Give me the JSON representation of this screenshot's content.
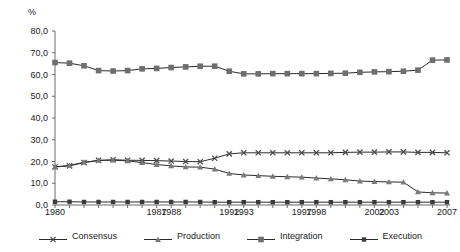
{
  "chart_data": {
    "type": "line",
    "title": "",
    "xlabel": "",
    "ylabel": "%",
    "ylim": [
      0,
      80
    ],
    "ytick_step": 10,
    "ytick_labels": [
      "80,0",
      "70,0",
      "60,0",
      "50,0",
      "40,0",
      "30,0",
      "20,0",
      "10,0",
      "0,0"
    ],
    "ytick_values": [
      80,
      70,
      60,
      50,
      40,
      30,
      20,
      10,
      0
    ],
    "grid": false,
    "legend_position": "bottom",
    "x": [
      1980,
      1981,
      1982,
      1983,
      1984,
      1985,
      1986,
      1987,
      1988,
      1989,
      1990,
      1991,
      1992,
      1993,
      1994,
      1995,
      1996,
      1997,
      1998,
      1999,
      2000,
      2001,
      2002,
      2003,
      2004,
      2005,
      2006,
      2007
    ],
    "xtick_labels": [
      "1980",
      "1987",
      "1988",
      "1992",
      "1993",
      "1997",
      "1998",
      "2002",
      "2003",
      "2007"
    ],
    "xtick_values": [
      1980,
      1987,
      1988,
      1992,
      1993,
      1997,
      1998,
      2002,
      2003,
      2007
    ],
    "series": [
      {
        "name": "Consensus",
        "marker": "x",
        "color": "#4d4d4d",
        "values": [
          17.5,
          18.0,
          19.5,
          20.5,
          20.8,
          20.6,
          20.5,
          20.4,
          20.2,
          20.0,
          19.9,
          21.5,
          23.5,
          24.0,
          24.0,
          24.0,
          24.0,
          24.0,
          24.0,
          24.0,
          24.2,
          24.3,
          24.3,
          24.4,
          24.4,
          24.2,
          24.2,
          24.0
        ]
      },
      {
        "name": "Production",
        "marker": "triangle",
        "color": "#7a7a7a",
        "values": [
          17.5,
          18.2,
          19.6,
          20.5,
          20.6,
          20.3,
          19.5,
          18.6,
          18.0,
          17.5,
          17.4,
          16.5,
          14.5,
          13.8,
          13.5,
          13.2,
          13.0,
          12.8,
          12.4,
          12.0,
          11.6,
          11.0,
          10.8,
          10.6,
          10.5,
          6.0,
          5.6,
          5.5
        ]
      },
      {
        "name": "Integration",
        "marker": "square",
        "color": "#6e6e6e",
        "values": [
          65.5,
          65.2,
          64.0,
          61.8,
          61.6,
          61.8,
          62.6,
          62.8,
          63.2,
          63.5,
          63.8,
          63.8,
          61.5,
          60.3,
          60.3,
          60.4,
          60.4,
          60.4,
          60.4,
          60.5,
          60.6,
          61.0,
          61.2,
          61.3,
          61.5,
          62.0,
          66.6,
          66.7
        ]
      },
      {
        "name": "Execution",
        "marker": "filled-square",
        "color": "#3a3a3a",
        "values": [
          1.5,
          1.5,
          1.4,
          1.4,
          1.4,
          1.4,
          1.4,
          1.4,
          1.4,
          1.4,
          1.4,
          1.3,
          1.3,
          1.3,
          1.3,
          1.3,
          1.3,
          1.3,
          1.3,
          1.3,
          1.3,
          1.3,
          1.3,
          1.3,
          1.3,
          1.3,
          1.3,
          1.3
        ]
      }
    ]
  },
  "legend": {
    "items": [
      {
        "label": "Consensus"
      },
      {
        "label": "Production"
      },
      {
        "label": "Integration"
      },
      {
        "label": "Execution"
      }
    ]
  },
  "axis": {
    "unit": "%"
  }
}
